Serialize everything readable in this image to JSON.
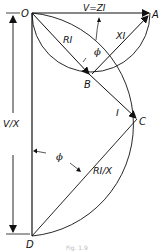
{
  "diagram": {
    "type": "phasor-circle-diagram",
    "points": {
      "O": "O",
      "A": "A",
      "B": "B",
      "C": "C",
      "D": "D"
    },
    "labels": {
      "voltage": "V=ZI",
      "resistive_drop": "RI",
      "reactive_drop": "XI",
      "current": "I",
      "current_locus": "RI/X",
      "phase_angle_top": "ϕ",
      "phase_angle_bottom": "ϕ",
      "diameter": "V/X"
    },
    "caption": "Fig. 1.9",
    "colors": {
      "line": "#111111",
      "background": "#ffffff",
      "caption": "#bbbbbb"
    }
  }
}
